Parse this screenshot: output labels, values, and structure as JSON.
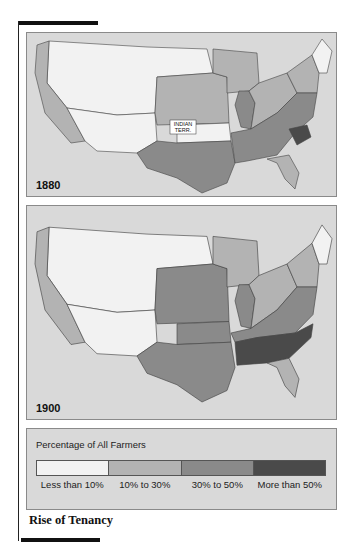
{
  "maps": [
    {
      "year": "1880",
      "annotation": "INDIAN TERR.",
      "regions": {
        "west": "#f2f2f2",
        "pacific": "#b3b3b3",
        "plains": "#b3b3b3",
        "midwest": "#b3b3b3",
        "illinois": "#8a8a8a",
        "northeast": "#b3b3b3",
        "new_england": "#f2f2f2",
        "texas": "#8a8a8a",
        "south": "#8a8a8a",
        "south_carolina": "#4a4a4a",
        "florida": "#b3b3b3",
        "indian_terr": "#f2f2f2"
      }
    },
    {
      "year": "1900",
      "regions": {
        "west": "#f2f2f2",
        "pacific": "#b3b3b3",
        "plains": "#8a8a8a",
        "midwest": "#b3b3b3",
        "illinois": "#8a8a8a",
        "northeast": "#b3b3b3",
        "new_england": "#f2f2f2",
        "texas": "#8a8a8a",
        "south": "#8a8a8a",
        "deep_south": "#4a4a4a",
        "florida": "#b3b3b3"
      }
    }
  ],
  "legend": {
    "title": "Percentage of All Farmers",
    "items": [
      {
        "label": "Less than 10%",
        "color": "#f2f2f2"
      },
      {
        "label": "10% to 30%",
        "color": "#b3b3b3"
      },
      {
        "label": "30% to 50%",
        "color": "#8a8a8a"
      },
      {
        "label": "More than 50%",
        "color": "#4a4a4a"
      }
    ]
  },
  "caption": "Rise of Tenancy"
}
